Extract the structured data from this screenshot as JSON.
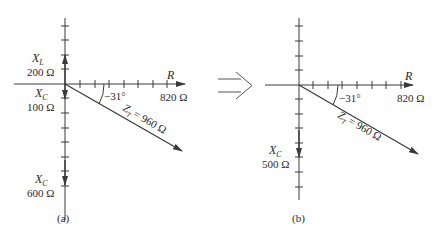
{
  "diagrams": [
    {
      "id": "a",
      "caption": "(a)",
      "x_axis_label": "R",
      "resistance": "820 Ω",
      "angle": "−31°",
      "impedance_label": "Z",
      "impedance_sub": "T",
      "impedance_value": "= 960 Ω",
      "phasors": [
        {
          "label": "X",
          "sub": "L",
          "value": "200 Ω",
          "direction": "up"
        },
        {
          "label": "X",
          "sub": "C",
          "value": "100 Ω",
          "direction": "down"
        },
        {
          "label": "X",
          "sub": "C",
          "value": "600 Ω",
          "direction": "down"
        }
      ]
    },
    {
      "id": "b",
      "caption": "(b)",
      "x_axis_label": "R",
      "resistance": "820 Ω",
      "angle": "−31°",
      "impedance_label": "Z",
      "impedance_sub": "T",
      "impedance_value": "= 960 Ω",
      "phasors": [
        {
          "label": "X",
          "sub": "C",
          "value": "500 Ω",
          "direction": "down"
        }
      ]
    }
  ],
  "transition": "double-arrow-right",
  "colors": {
    "line": "#3a3a3a",
    "text": "#2a2a2a",
    "background": "#ffffff"
  }
}
